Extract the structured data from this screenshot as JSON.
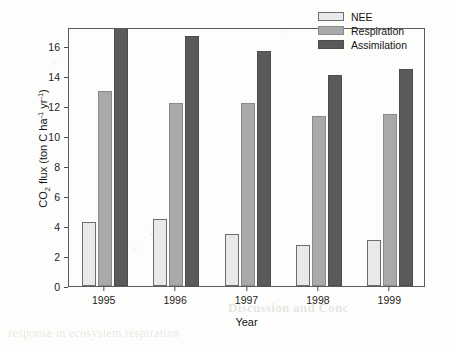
{
  "chart_data": {
    "type": "bar",
    "title": "",
    "xlabel": "Year",
    "ylabel": "CO2 flux (ton C ha-1 yr-1)",
    "ylabel_parts": {
      "lead": "CO",
      "sub1": "2",
      "mid": " flux (ton C ha",
      "sup1": "-1",
      "mid2": " yr",
      "sup2": "-1",
      "tail": ")"
    },
    "categories": [
      "1995",
      "1996",
      "1997",
      "1998",
      "1999"
    ],
    "yticks": [
      0,
      2,
      4,
      6,
      8,
      10,
      12,
      14,
      16
    ],
    "ylim": [
      0,
      17.3
    ],
    "grid": false,
    "legend_position": "top-right",
    "note": "1995 Assimilation bar is clipped at the top of the plot frame",
    "series": [
      {
        "name": "NEE",
        "color": "#e9e9e9",
        "edge": "#6d6d6d",
        "values": [
          4.25,
          4.45,
          3.45,
          2.75,
          3.1
        ]
      },
      {
        "name": "Respiration",
        "color": "#a9a9a9",
        "edge": "#8a8a8a",
        "values": [
          13.0,
          12.25,
          12.25,
          11.35,
          11.5
        ]
      },
      {
        "name": "Assimilation",
        "color": "#5a5a5a",
        "edge": "#4d4d4d",
        "values": [
          17.35,
          16.7,
          15.7,
          14.1,
          14.5
        ]
      }
    ]
  },
  "legend": {
    "items": [
      {
        "label": "NEE"
      },
      {
        "label": "Respiration"
      },
      {
        "label": "Assimilation"
      }
    ]
  },
  "background_text": {
    "line1": "Discussion and Conc",
    "line2": "response in ecosystem respiration",
    "line3": "and"
  }
}
